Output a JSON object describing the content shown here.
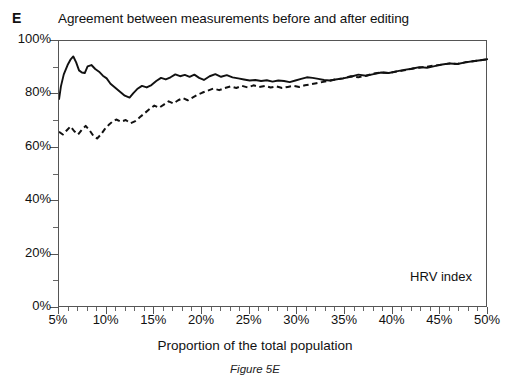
{
  "panel": {
    "label": "E"
  },
  "title": "Agreement between measurements before and after editing",
  "axis": {
    "x_title": "Proportion of the total population",
    "y_ticks": [
      "0%",
      "20%",
      "40%",
      "60%",
      "80%",
      "100%"
    ],
    "x_ticks": [
      "5%",
      "10%",
      "15%",
      "20%",
      "25%",
      "30%",
      "35%",
      "40%",
      "45%",
      "50%"
    ]
  },
  "annotation": "HRV index",
  "caption": "Figure 5E",
  "colors": {
    "line": "#111111",
    "axis": "#555555",
    "background": "#ffffff"
  },
  "chart_data": {
    "type": "line",
    "title": "Agreement between measurements before and after editing",
    "subtitle": "",
    "xlabel": "Proportion of the total population",
    "ylabel": "",
    "xlim": [
      5,
      50
    ],
    "ylim": [
      0,
      100
    ],
    "x_tick_values": [
      5,
      10,
      15,
      20,
      25,
      30,
      35,
      40,
      45,
      50
    ],
    "y_tick_values": [
      0,
      20,
      40,
      60,
      80,
      100
    ],
    "x_minor_tick_step": 1,
    "y_minor_tick_step": 10,
    "grid": false,
    "legend": false,
    "legend_position": "none",
    "annotations": [
      {
        "text": "HRV index",
        "x": 44,
        "y": 13
      },
      {
        "text": "E",
        "x": 0,
        "y": 108
      }
    ],
    "series": [
      {
        "name": "solid",
        "style": "solid",
        "color": "#111111",
        "x": [
          5.0,
          5.2,
          5.5,
          5.9,
          6.2,
          6.5,
          6.8,
          7.1,
          7.4,
          7.7,
          8.0,
          8.4,
          8.8,
          9.2,
          9.6,
          10.0,
          10.4,
          10.9,
          11.4,
          11.9,
          12.4,
          12.8,
          13.2,
          13.7,
          14.2,
          14.7,
          15.2,
          15.7,
          16.2,
          16.7,
          17.2,
          17.7,
          18.2,
          18.7,
          19.2,
          19.7,
          20.2,
          20.8,
          21.4,
          22.0,
          22.6,
          23.2,
          23.8,
          24.4,
          25.0,
          25.6,
          26.2,
          26.8,
          27.4,
          28.0,
          28.6,
          29.2,
          29.8,
          30.4,
          31.0,
          31.6,
          32.2,
          32.8,
          33.4,
          34.0,
          34.8,
          35.6,
          36.4,
          37.2,
          38.0,
          38.8,
          39.6,
          40.4,
          41.2,
          42.0,
          42.8,
          43.6,
          44.4,
          45.2,
          46.0,
          46.8,
          47.6,
          48.4,
          49.2,
          50.0
        ],
        "y": [
          78.0,
          83.0,
          87.5,
          91.0,
          93.0,
          94.2,
          92.0,
          89.0,
          88.2,
          88.0,
          90.5,
          91.0,
          89.5,
          88.5,
          87.0,
          86.0,
          84.0,
          82.5,
          81.0,
          79.5,
          78.8,
          80.5,
          82.0,
          83.2,
          82.6,
          83.5,
          85.0,
          86.2,
          85.6,
          86.4,
          87.5,
          86.8,
          87.3,
          86.6,
          87.4,
          86.2,
          85.4,
          86.8,
          87.6,
          86.6,
          87.2,
          86.4,
          86.0,
          85.6,
          85.2,
          85.4,
          85.0,
          85.3,
          84.8,
          85.2,
          85.0,
          84.6,
          85.2,
          85.8,
          86.4,
          86.2,
          85.8,
          85.4,
          85.2,
          85.6,
          86.0,
          86.6,
          87.4,
          87.0,
          87.6,
          88.2,
          88.0,
          88.6,
          89.2,
          89.6,
          90.2,
          90.0,
          90.6,
          91.2,
          91.6,
          91.4,
          92.0,
          92.4,
          92.8,
          93.2
        ]
      },
      {
        "name": "dashed",
        "style": "dashed",
        "color": "#111111",
        "x": [
          5.0,
          5.4,
          5.8,
          6.2,
          6.6,
          7.0,
          7.4,
          7.8,
          8.2,
          8.6,
          9.0,
          9.4,
          9.8,
          10.2,
          10.6,
          11.0,
          11.5,
          12.0,
          12.5,
          13.0,
          13.5,
          14.0,
          14.5,
          15.0,
          15.5,
          16.0,
          16.5,
          17.0,
          17.5,
          18.0,
          18.5,
          19.0,
          19.5,
          20.0,
          20.6,
          21.2,
          21.8,
          22.4,
          23.0,
          23.6,
          24.2,
          24.8,
          25.4,
          26.0,
          26.6,
          27.2,
          27.8,
          28.4,
          29.0,
          29.6,
          30.2,
          30.8,
          31.4,
          32.0,
          32.6,
          33.2,
          34.0,
          34.8,
          35.6,
          36.4,
          37.2,
          38.0,
          38.8,
          39.6,
          40.4,
          41.2,
          42.0,
          42.8,
          43.6,
          44.4,
          45.2,
          46.0,
          46.8,
          47.6,
          48.4,
          49.2,
          50.0
        ],
        "y": [
          66.0,
          65.0,
          66.5,
          68.0,
          66.2,
          65.0,
          66.8,
          68.2,
          66.6,
          64.5,
          63.5,
          65.0,
          67.0,
          68.5,
          69.8,
          70.6,
          69.8,
          70.4,
          69.2,
          70.0,
          71.5,
          73.0,
          74.5,
          75.8,
          75.0,
          76.2,
          77.4,
          76.6,
          77.8,
          78.6,
          77.8,
          78.8,
          79.8,
          80.6,
          81.4,
          82.2,
          81.6,
          82.4,
          83.0,
          82.4,
          83.2,
          82.6,
          83.4,
          82.8,
          83.2,
          82.6,
          83.0,
          82.4,
          82.8,
          83.2,
          82.8,
          83.4,
          83.8,
          84.2,
          84.6,
          85.0,
          85.6,
          86.0,
          86.8,
          86.4,
          87.0,
          87.8,
          88.2,
          88.0,
          88.6,
          89.0,
          89.6,
          90.0,
          90.4,
          90.8,
          91.2,
          91.6,
          91.4,
          92.0,
          92.4,
          92.8,
          93.2
        ]
      }
    ]
  }
}
